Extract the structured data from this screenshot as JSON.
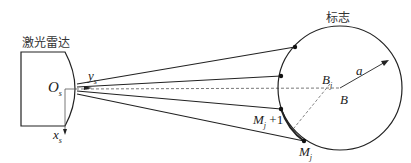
{
  "diagram": {
    "radar_label": "激光雷达",
    "target_label": "标志",
    "origin_label": "O",
    "origin_sub": "s",
    "y_axis_label": "y",
    "y_axis_sub": "s",
    "x_axis_label": "x",
    "x_axis_sub": "s",
    "center_label": "B",
    "projected_center_label": "B",
    "projected_center_sub": "j",
    "radius_label": "a",
    "point_mj_label": "M",
    "point_mj_sub": "j",
    "point_mj1_label": "M",
    "point_mj1_sub": "j",
    "point_mj1_suffix": " +1"
  },
  "colors": {
    "stroke": "#222222",
    "dashed": "#555555",
    "background": "#ffffff"
  }
}
